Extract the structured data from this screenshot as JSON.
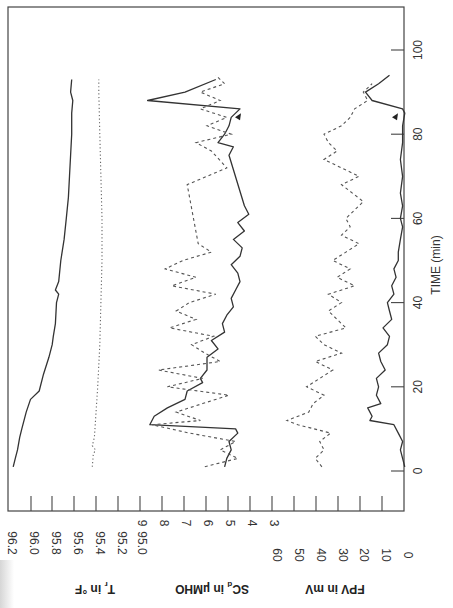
{
  "chart_data": {
    "type": "line",
    "orientation": "rotated-90 (time runs vertically, values horizontally)",
    "title": "",
    "xlabel": "TIME (min)",
    "x_ticks": [
      0,
      20,
      40,
      60,
      80,
      100
    ],
    "xlim": [
      0,
      105
    ],
    "panels": [
      {
        "name": "T_r",
        "ylabel": "T_r in °F",
        "y_ticks": [
          "96.2",
          "96.0",
          "95.8",
          "95.6",
          "95.4",
          "95.2",
          "95.0"
        ],
        "ylim": [
          95.0,
          96.2
        ],
        "series": [
          {
            "name": "T_r solid",
            "style": "solid",
            "x": [
              1,
              3,
              5,
              8,
              10,
              14,
              17,
              19,
              23,
              27,
              28,
              30,
              32,
              35,
              40,
              42,
              43,
              45,
              50,
              55,
              60,
              65,
              70,
              75,
              80,
              85,
              88,
              90,
              93
            ],
            "y": [
              96.18,
              96.16,
              96.14,
              96.12,
              96.1,
              96.06,
              96.02,
              95.94,
              95.9,
              95.85,
              95.84,
              95.82,
              95.81,
              95.79,
              95.78,
              95.76,
              95.79,
              95.76,
              95.74,
              95.71,
              95.69,
              95.67,
              95.66,
              95.65,
              95.64,
              95.64,
              95.63,
              95.65,
              95.64
            ]
          },
          {
            "name": "T_r dotted",
            "style": "dotted",
            "x": [
              1,
              4,
              5,
              6,
              8,
              12,
              20,
              30,
              40,
              50,
              60,
              70,
              80,
              90,
              93
            ],
            "y": [
              95.45,
              95.44,
              95.42,
              95.45,
              95.43,
              95.42,
              95.4,
              95.38,
              95.37,
              95.36,
              95.36,
              95.37,
              95.38,
              95.39,
              95.39
            ]
          }
        ]
      },
      {
        "name": "SC_d",
        "ylabel": "SC_d in µMHO",
        "y_ticks": [
          "9",
          "8",
          "7",
          "6",
          "5",
          "4",
          "3"
        ],
        "ylim": [
          3,
          9
        ],
        "series": [
          {
            "name": "SC_d solid",
            "style": "solid",
            "x": [
              1,
              3,
              5,
              7,
              9,
              10,
              11,
              13,
              15,
              17,
              19,
              21,
              22,
              24,
              27,
              29,
              31,
              33,
              35,
              37,
              39,
              41,
              43,
              45,
              47,
              49,
              51,
              53,
              55,
              57,
              59,
              61,
              63,
              75,
              77,
              78,
              80,
              82,
              84,
              86,
              88,
              90,
              93
            ],
            "y": [
              5.2,
              5.1,
              4.9,
              5.0,
              4.6,
              4.7,
              8.6,
              8.4,
              7.8,
              7.0,
              6.9,
              6.2,
              6.3,
              6.0,
              6.0,
              5.5,
              5.8,
              5.2,
              5.3,
              5.1,
              4.8,
              4.9,
              4.7,
              4.5,
              4.6,
              4.9,
              4.5,
              4.4,
              4.8,
              4.3,
              4.6,
              4.1,
              4.3,
              5.0,
              4.8,
              5.5,
              5.2,
              5.0,
              4.9,
              4.5,
              8.7,
              7.0,
              5.6
            ]
          },
          {
            "name": "SC_d dashed",
            "style": "dashed",
            "x": [
              1,
              3,
              5,
              7,
              9,
              11,
              12,
              14,
              16,
              18,
              20,
              22,
              24,
              26,
              28,
              30,
              32,
              34,
              36,
              38,
              40,
              42,
              44,
              46,
              48,
              50,
              52,
              54,
              68,
              72,
              76,
              78,
              80,
              82,
              84,
              86,
              88,
              90,
              92,
              94
            ],
            "y": [
              6.1,
              4.6,
              5.4,
              4.7,
              6.8,
              8.5,
              6.3,
              7.4,
              6.2,
              5.0,
              7.8,
              6.2,
              8.2,
              5.4,
              6.1,
              6.7,
              5.7,
              7.7,
              6.5,
              7.4,
              6.8,
              5.6,
              7.6,
              6.5,
              7.9,
              7.1,
              5.8,
              6.4,
              6.9,
              5.1,
              5.8,
              6.5,
              4.9,
              6.0,
              5.1,
              6.3,
              5.4,
              6.3,
              5.2,
              5.6
            ]
          }
        ],
        "annotations": [
          {
            "type": "arrow",
            "x": 84,
            "label": "▲"
          }
        ]
      },
      {
        "name": "FPV",
        "ylabel": "FPV in mV",
        "y_ticks": [
          "60",
          "50",
          "40",
          "30",
          "20",
          "10",
          "0"
        ],
        "ylim": [
          0,
          60
        ],
        "series": [
          {
            "name": "FPV solid",
            "style": "solid",
            "x": [
              1,
              3,
              5,
              7,
              9,
              11,
              12,
              13,
              15,
              16,
              18,
              20,
              22,
              24,
              26,
              28,
              30,
              32,
              34,
              36,
              38,
              40,
              42,
              44,
              46,
              48,
              50,
              52,
              55,
              58,
              60,
              63,
              66,
              70,
              74,
              78,
              82,
              85,
              86,
              88,
              90,
              92,
              94
            ],
            "y": [
              1,
              2,
              3,
              2,
              4,
              6,
              17,
              16,
              18,
              12,
              14,
              13,
              14,
              10,
              12,
              13,
              9,
              8,
              11,
              7,
              8,
              9,
              6,
              7,
              5,
              6,
              4,
              4,
              3,
              2,
              3,
              2,
              3,
              2,
              3,
              2,
              2,
              1,
              2,
              16,
              19,
              13,
              8
            ]
          },
          {
            "name": "FPV dashed",
            "style": "dashed",
            "x": [
              1,
              3,
              5,
              7,
              9,
              11,
              12,
              14,
              16,
              18,
              20,
              22,
              24,
              26,
              28,
              30,
              32,
              34,
              36,
              38,
              40,
              42,
              44,
              46,
              48,
              50,
              52,
              54,
              56,
              58,
              60,
              62,
              64,
              66,
              68,
              70,
              72,
              74,
              76,
              78,
              80,
              82,
              84,
              86,
              88,
              90,
              92
            ],
            "y": [
              39,
              42,
              38,
              40,
              35,
              50,
              55,
              45,
              43,
              38,
              46,
              40,
              34,
              42,
              30,
              38,
              42,
              28,
              32,
              36,
              30,
              36,
              24,
              32,
              26,
              34,
              28,
              22,
              30,
              26,
              28,
              24,
              20,
              25,
              30,
              22,
              30,
              38,
              32,
              36,
              38,
              30,
              26,
              24,
              18,
              20,
              16
            ]
          }
        ],
        "annotations": [
          {
            "type": "arrow",
            "x": 84,
            "label": "▲"
          }
        ]
      }
    ]
  },
  "axis": {
    "time_label": "TIME (min)",
    "time_ticks": [
      "0",
      "20",
      "40",
      "60",
      "80",
      "100"
    ],
    "tr_label": "T",
    "tr_sub": "r",
    "tr_unit": " in °F",
    "sc_label": "SC",
    "sc_sub": "d",
    "sc_unit": " in µMHO",
    "fpv_label": "FPV in mV",
    "tr_ticks": [
      "96.2",
      "96.0",
      "95.8",
      "95.6",
      "95.4",
      "95.2",
      "95.0"
    ],
    "sc_ticks": [
      "9",
      "8",
      "7",
      "6",
      "5",
      "4",
      "3"
    ],
    "fpv_ticks": [
      "60",
      "50",
      "40",
      "30",
      "20",
      "10",
      "0"
    ]
  }
}
